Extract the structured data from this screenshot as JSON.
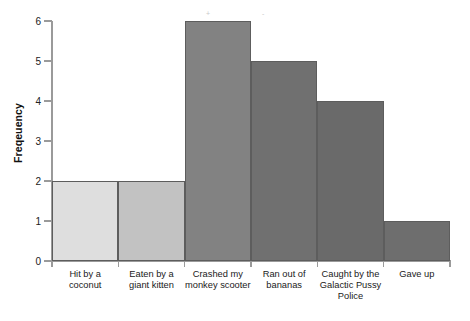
{
  "chart_data": {
    "type": "bar",
    "title": "",
    "subtitle": "",
    "xlabel": "",
    "ylabel": "Freqeuency",
    "categories": [
      "Hit by a coconut",
      "Eaten by a giant kitten",
      "Crashed my monkey scooter",
      "Ran out of bananas",
      "Caught by the Galactic Pussy Police",
      "Gave up"
    ],
    "values": [
      2,
      2,
      6,
      5,
      4,
      1
    ],
    "bar_colors": [
      "#dedede",
      "#c2c2c2",
      "#828282",
      "#707070",
      "#6a6a6a",
      "#6e6e6e"
    ],
    "bar_edge_color": "#5d5d5d",
    "ylim": [
      0,
      6
    ],
    "ytick_labels": [
      "0",
      "1",
      "2",
      "3",
      "4",
      "5",
      "6"
    ],
    "ytick_values": [
      0,
      1,
      2,
      3,
      4,
      5,
      6
    ],
    "grid": false,
    "legend": null,
    "bar_gap": 0,
    "axis_color": "#9a9a9a"
  },
  "artifacts": [
    {
      "glyph": "+",
      "x": 206,
      "y": 10
    },
    {
      "glyph": "-",
      "x": 262,
      "y": 10
    }
  ]
}
